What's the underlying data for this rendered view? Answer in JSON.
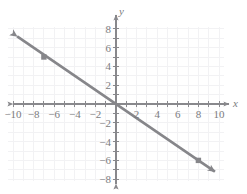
{
  "figure": {
    "background_color": "#ffffff",
    "grid_color": "#f2f2f4",
    "axis_color": "#88888c",
    "line_color": "#86868a",
    "label_color": "#7c7c80",
    "point_color": "#86868a"
  },
  "axes": {
    "x_name": "x",
    "y_name": "y",
    "x_ticks": [
      {
        "value": -10,
        "label": "−10"
      },
      {
        "value": -8,
        "label": "−8"
      },
      {
        "value": -6,
        "label": "−6"
      },
      {
        "value": -4,
        "label": "−4"
      },
      {
        "value": -2,
        "label": "−2"
      },
      {
        "value": 2,
        "label": "2"
      },
      {
        "value": 4,
        "label": "4"
      },
      {
        "value": 6,
        "label": "6"
      },
      {
        "value": 8,
        "label": "8"
      },
      {
        "value": 10,
        "label": "10"
      }
    ],
    "y_ticks": [
      {
        "value": 8,
        "label": "8"
      },
      {
        "value": 6,
        "label": "6"
      },
      {
        "value": 4,
        "label": "4"
      },
      {
        "value": 2,
        "label": "2"
      },
      {
        "value": -2,
        "label": "−2"
      },
      {
        "value": -4,
        "label": "−4"
      },
      {
        "value": -6,
        "label": "−6"
      },
      {
        "value": -8,
        "label": "−8"
      }
    ]
  },
  "chart_data": {
    "type": "line",
    "title": "",
    "xlabel": "x",
    "ylabel": "y",
    "xlim": [
      -11,
      11
    ],
    "ylim": [
      -8.6,
      8.6
    ],
    "grid": true,
    "grid_step": 1,
    "tick_step": 1,
    "tick_label_step": 2,
    "legend": "none",
    "series": [
      {
        "name": "line",
        "type": "line",
        "slope": -0.75,
        "intercept": 0,
        "equation": "y = -3/4 x",
        "arrow_start": true,
        "arrow_end": true,
        "x": [
          -9.6,
          9.6
        ],
        "y": [
          7.2,
          -7.2
        ]
      },
      {
        "name": "plotted-points",
        "type": "scatter",
        "marker": "square",
        "x": [
          -7,
          8
        ],
        "y": [
          5,
          -6
        ],
        "points": [
          {
            "x": -7,
            "y": 5
          },
          {
            "x": 8,
            "y": -6
          }
        ]
      }
    ]
  }
}
